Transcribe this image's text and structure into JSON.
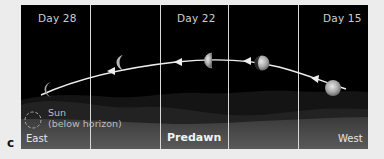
{
  "figure": {
    "label": "c",
    "panels": [
      {
        "label": "Day 28"
      },
      {
        "label": ""
      },
      {
        "label": "Day 22"
      },
      {
        "label": ""
      },
      {
        "label": "Day 15"
      }
    ],
    "moons": [
      {
        "day": 28,
        "phase": "thin waning crescent"
      },
      {
        "day": "",
        "phase": "waning crescent"
      },
      {
        "day": 22,
        "phase": "third quarter"
      },
      {
        "day": "",
        "phase": "waning gibbous"
      },
      {
        "day": 15,
        "phase": "full moon"
      }
    ],
    "horizon": {
      "east_label": "East",
      "center_label": "Predawn",
      "west_label": "West"
    },
    "sun": {
      "label_line1": "Sun",
      "label_line2": "(below horizon)"
    },
    "colors": {
      "sky": "#000000",
      "ground": "#4a4a4a",
      "hills": "#1c1c1c",
      "path": "#f0f0f0",
      "divider": "#d8d8d8",
      "background": "#ececec"
    }
  }
}
